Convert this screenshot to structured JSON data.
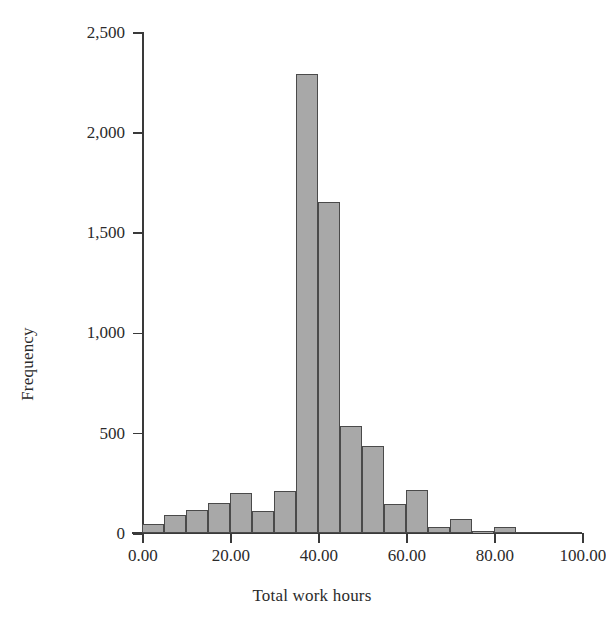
{
  "chart_data": {
    "type": "bar",
    "subtype": "histogram",
    "title": "",
    "xlabel": "Total work hours",
    "ylabel": "Frequency",
    "xlim": [
      0,
      100
    ],
    "ylim": [
      0,
      2500
    ],
    "bin_width": 5,
    "grid": false,
    "legend": null,
    "xticks": [
      0,
      20,
      40,
      60,
      80,
      100
    ],
    "xtick_labels": [
      "0.00",
      "20.00",
      "40.00",
      "60.00",
      "80.00",
      "100.00"
    ],
    "yticks": [
      0,
      500,
      1000,
      1500,
      2000,
      2500
    ],
    "ytick_labels": [
      "0",
      "500",
      "1,000",
      "1,500",
      "2,000",
      "2,500"
    ],
    "bar_fill_color": "#a8a8a8",
    "bar_edge_color": "#4a4a4a",
    "axis_color": "#3a3a3a",
    "background_color": "#ffffff",
    "bins": [
      {
        "x0": 0,
        "x1": 5,
        "center": 2.5,
        "value": 45
      },
      {
        "x0": 5,
        "x1": 10,
        "center": 7.5,
        "value": 90
      },
      {
        "x0": 10,
        "x1": 15,
        "center": 12.5,
        "value": 115
      },
      {
        "x0": 15,
        "x1": 20,
        "center": 17.5,
        "value": 150
      },
      {
        "x0": 20,
        "x1": 25,
        "center": 22.5,
        "value": 200
      },
      {
        "x0": 25,
        "x1": 30,
        "center": 27.5,
        "value": 110
      },
      {
        "x0": 30,
        "x1": 35,
        "center": 32.5,
        "value": 210
      },
      {
        "x0": 35,
        "x1": 40,
        "center": 37.5,
        "value": 2290
      },
      {
        "x0": 40,
        "x1": 45,
        "center": 42.5,
        "value": 1650
      },
      {
        "x0": 45,
        "x1": 50,
        "center": 47.5,
        "value": 535
      },
      {
        "x0": 50,
        "x1": 55,
        "center": 52.5,
        "value": 435
      },
      {
        "x0": 55,
        "x1": 60,
        "center": 57.5,
        "value": 145
      },
      {
        "x0": 60,
        "x1": 65,
        "center": 62.5,
        "value": 215
      },
      {
        "x0": 65,
        "x1": 70,
        "center": 67.5,
        "value": 30
      },
      {
        "x0": 70,
        "x1": 75,
        "center": 72.5,
        "value": 70
      },
      {
        "x0": 75,
        "x1": 80,
        "center": 77.5,
        "value": 8
      },
      {
        "x0": 80,
        "x1": 85,
        "center": 82.5,
        "value": 28
      },
      {
        "x0": 85,
        "x1": 90,
        "center": 87.5,
        "value": 6
      },
      {
        "x0": 90,
        "x1": 95,
        "center": 92.5,
        "value": 5
      },
      {
        "x0": 95,
        "x1": 100,
        "center": 97.5,
        "value": 4
      }
    ]
  }
}
